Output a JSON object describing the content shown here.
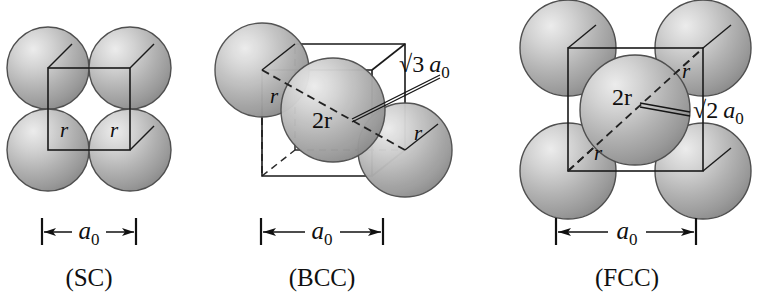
{
  "figure": {
    "background_color": "#ffffff",
    "line_color": "#1a1a1a",
    "sphere_color_light": "#e8e8e8",
    "sphere_color_mid": "#b4b4b4",
    "sphere_color_dark": "#8a8a8a",
    "sphere_edge_color": "#4a4a4a"
  },
  "panels": [
    {
      "id": "sc",
      "caption": "(SC)",
      "dimension_label": "a",
      "dimension_subscript": "0",
      "sphere_count": 4,
      "radius_labels": [
        "r",
        "r"
      ],
      "diagonal_label": null,
      "center_sphere_label": null,
      "description": "Simple cubic: four spheres touching along the cube edge"
    },
    {
      "id": "bcc",
      "caption": "(BCC)",
      "dimension_label": "a",
      "dimension_subscript": "0",
      "sphere_count": 3,
      "radius_labels": [
        "r",
        "r"
      ],
      "center_sphere_label": "2r",
      "diagonal_label_root": "√3",
      "diagonal_label_var": "a",
      "diagonal_label_sub": "0",
      "description": "Body-centered cubic: body diagonal equals 4r = √3 a0"
    },
    {
      "id": "fcc",
      "caption": "(FCC)",
      "dimension_label": "a",
      "dimension_subscript": "0",
      "sphere_count": 5,
      "radius_labels": [
        "r",
        "r"
      ],
      "center_sphere_label": "2r",
      "diagonal_label_root": "√2",
      "diagonal_label_var": "a",
      "diagonal_label_sub": "0",
      "description": "Face-centered cubic: face diagonal equals 4r = √2 a0"
    }
  ]
}
